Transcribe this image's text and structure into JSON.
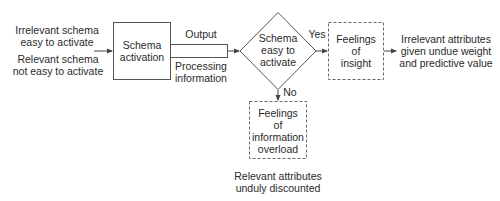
{
  "diagram": {
    "inputs": {
      "line1": "Irrelevant schema",
      "line2": "easy to activate",
      "line3": "Relevant schema",
      "line4": "not easy to activate"
    },
    "process_box": {
      "line1": "Schema",
      "line2": "activation"
    },
    "pipe": {
      "top_label": "Output",
      "bottom_line1": "Processing",
      "bottom_line2": "information"
    },
    "decision": {
      "line1": "Schema",
      "line2": "easy to",
      "line3": "activate",
      "yes_label": "Yes",
      "no_label": "No"
    },
    "insight_box": {
      "line1": "Feelings",
      "line2": "of",
      "line3": "insight"
    },
    "insight_outcome": {
      "line1": "Irrelevant attributes",
      "line2": "given undue weight",
      "line3": "and predictive value"
    },
    "overload_box": {
      "line1": "Feelings",
      "line2": "of",
      "line3": "information",
      "line4": "overload"
    },
    "overload_outcome": {
      "line1": "Relevant attributes",
      "line2": "unduly discounted"
    },
    "colors": {
      "stroke": "#555555",
      "text": "#2a2a2a",
      "background": "#ffffff"
    }
  }
}
